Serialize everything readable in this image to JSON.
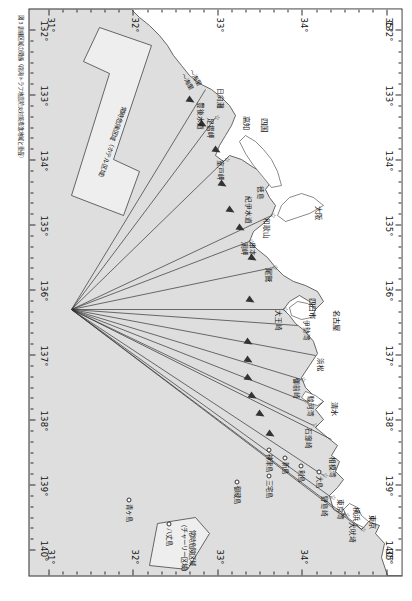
{
  "figure": {
    "caption": "図 3 訓練区域の関係（南海トラフ地震防災対策推進地域と重畳）"
  },
  "axes": {
    "longitude_unit": "°",
    "longitude_ticks": [
      "132°",
      "133°",
      "134°",
      "135°",
      "136°",
      "137°",
      "138°",
      "139°",
      "140°"
    ],
    "latitude_ticks": [
      "31°",
      "32°",
      "33°",
      "34°",
      "35°"
    ],
    "top_latitude_labels": [
      "35°",
      "34°",
      "33°",
      "32°",
      "31°"
    ],
    "bottom_latitude_labels": [
      "34°",
      "33°",
      "32°",
      "31°"
    ]
  },
  "zones": [
    {
      "name": "charlie-zone",
      "line1": "常時危険区域",
      "line2": "（チャーリー区域）"
    },
    {
      "name": "hotel-zone",
      "line1": "常時危険区域（ホテル区域）"
    }
  ],
  "cities": [
    {
      "label": "東京",
      "x": 505,
      "y": 24
    },
    {
      "label": "横浜",
      "x": 497,
      "y": 40
    },
    {
      "label": "名古屋",
      "x": 300,
      "y": 60
    },
    {
      "label": "四日市",
      "x": 288,
      "y": 84
    },
    {
      "label": "清水",
      "x": 392,
      "y": 62
    },
    {
      "label": "大阪",
      "x": 196,
      "y": 78
    },
    {
      "label": "尾鷲",
      "x": 258,
      "y": 128
    },
    {
      "label": "高知",
      "x": 106,
      "y": 150
    },
    {
      "label": "四国",
      "x": 108,
      "y": 132
    }
  ],
  "bays": [
    {
      "label": "東京湾",
      "x": 489,
      "y": 56
    },
    {
      "label": "相模湾",
      "x": 447,
      "y": 64
    },
    {
      "label": "駿河湾",
      "x": 386,
      "y": 86
    },
    {
      "label": "伊勢湾",
      "x": 310,
      "y": 90
    },
    {
      "label": "紀伊水道",
      "x": 186,
      "y": 148
    },
    {
      "label": "豊後水道",
      "x": 92,
      "y": 196
    },
    {
      "label": "大王崎",
      "x": 300,
      "y": 118
    },
    {
      "label": "潮岬",
      "x": 232,
      "y": 152
    },
    {
      "label": "室戸岬",
      "x": 150,
      "y": 176
    },
    {
      "label": "足摺岬",
      "x": 108,
      "y": 186
    },
    {
      "label": "日向灘",
      "x": 78,
      "y": 176
    },
    {
      "label": "御前崎",
      "x": 368,
      "y": 100
    },
    {
      "label": "石廊崎",
      "x": 418,
      "y": 88
    },
    {
      "label": "野島崎",
      "x": 486,
      "y": 72
    },
    {
      "label": "犬吠埼",
      "x": 512,
      "y": 44
    },
    {
      "label": "浜松",
      "x": 348,
      "y": 76
    },
    {
      "label": "和歌山",
      "x": 208,
      "y": 130
    },
    {
      "label": "串本",
      "x": 232,
      "y": 144
    },
    {
      "label": "徳島",
      "x": 176,
      "y": 136
    }
  ],
  "islands": [
    {
      "label": "八丈島",
      "x": 518,
      "y": 228
    },
    {
      "label": "青ヶ島",
      "x": 494,
      "y": 268
    },
    {
      "label": "三宅島",
      "x": 470,
      "y": 128
    },
    {
      "label": "御蔵島",
      "x": 476,
      "y": 160
    },
    {
      "label": "神津島",
      "x": 444,
      "y": 128
    },
    {
      "label": "新島",
      "x": 452,
      "y": 112
    },
    {
      "label": "利島",
      "x": 460,
      "y": 96
    },
    {
      "label": "大島",
      "x": 466,
      "y": 78
    }
  ],
  "bearings": [
    {
      "value": "244°",
      "x": 478,
      "y": 54
    },
    {
      "value": "262°",
      "x": 462,
      "y": 70
    },
    {
      "value": "252°",
      "x": 452,
      "y": 82
    },
    {
      "value": "315°",
      "x": 440,
      "y": 96
    },
    {
      "value": "270°",
      "x": 404,
      "y": 104
    },
    {
      "value": "247.5°",
      "x": 388,
      "y": 140
    },
    {
      "value": "245°",
      "x": 372,
      "y": 150
    },
    {
      "value": "240°",
      "x": 356,
      "y": 150
    },
    {
      "value": "232°",
      "x": 340,
      "y": 148
    },
    {
      "value": "269°",
      "x": 326,
      "y": 148
    },
    {
      "value": "227°",
      "x": 282,
      "y": 146
    },
    {
      "value": "250°",
      "x": 250,
      "y": 114
    },
    {
      "value": "295°",
      "x": 218,
      "y": 136
    },
    {
      "value": "315°",
      "x": 206,
      "y": 142
    },
    {
      "value": "262°",
      "x": 196,
      "y": 160
    },
    {
      "value": "252°",
      "x": 190,
      "y": 166
    },
    {
      "value": "253°",
      "x": 184,
      "y": 170
    },
    {
      "value": "222°",
      "x": 160,
      "y": 172
    },
    {
      "value": "303°",
      "x": 132,
      "y": 170
    },
    {
      "value": "242°",
      "x": 140,
      "y": 178
    },
    {
      "value": "330°",
      "x": 116,
      "y": 190
    },
    {
      "value": "318°",
      "x": 100,
      "y": 196
    },
    {
      "value": "272°",
      "x": 86,
      "y": 208
    }
  ],
  "annotations": [
    {
      "label": "～海里",
      "x": 58,
      "y": 206
    },
    {
      "label": "～海里",
      "x": 62,
      "y": 214
    }
  ],
  "colors": {
    "land": "#dedede",
    "sea": "#ffffff",
    "route": "#333333",
    "zone_fill": "#eeeeee",
    "frame": "#2b2b2b"
  }
}
